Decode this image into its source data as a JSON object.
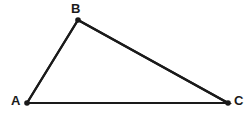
{
  "figure": {
    "kind": "geometry-diagram",
    "shape_name": "triangle",
    "width": 251,
    "height": 118,
    "background_color": "#ffffff",
    "stroke_color": "#1a1a1a",
    "stroke_width": 2.2,
    "vertex_dot_color": "#1a1a1a",
    "vertex_dot_radius": 2.8,
    "label_color": "#1a1a1a",
    "label_font_size": 13,
    "label_font_weight": "bold"
  },
  "vertices": [
    {
      "id": "A",
      "label": "A",
      "x": 27,
      "y": 103,
      "label_x": 11,
      "label_y": 94
    },
    {
      "id": "B",
      "label": "B",
      "x": 78,
      "y": 20,
      "label_x": 71,
      "label_y": 2
    },
    {
      "id": "C",
      "label": "C",
      "x": 228,
      "y": 103,
      "label_x": 234,
      "label_y": 94
    }
  ],
  "edges": [
    {
      "id": "AB",
      "from": "A",
      "to": "B",
      "x1": 27,
      "y1": 103,
      "x2": 78,
      "y2": 20
    },
    {
      "id": "BC",
      "from": "B",
      "to": "C",
      "x1": 78,
      "y1": 20,
      "x2": 228,
      "y2": 103
    },
    {
      "id": "CA",
      "from": "C",
      "to": "A",
      "x1": 228,
      "y1": 103,
      "x2": 27,
      "y2": 103
    }
  ],
  "polygon_points": "27,103 78,20 228,103"
}
